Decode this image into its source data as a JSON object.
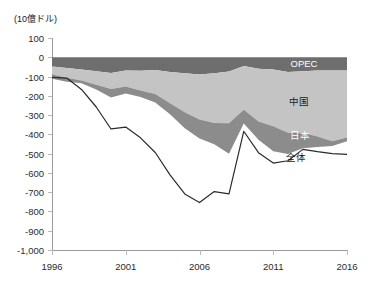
{
  "unit_label": "(10億ドル)",
  "axes": {
    "y_ticks": [
      100,
      0,
      -100,
      -200,
      -300,
      -400,
      -500,
      -600,
      -700,
      -800,
      -900,
      -1000
    ],
    "y_tick_labels": [
      "100",
      "0",
      "-100",
      "-200",
      "-300",
      "-400",
      "-500",
      "-600",
      "-700",
      "-800",
      "-900",
      "-1,000"
    ],
    "x_ticks": [
      1996,
      2001,
      2006,
      2011,
      2016
    ],
    "x_tick_labels": [
      "1996",
      "2001",
      "2006",
      "2011",
      "2016"
    ]
  },
  "labels": {
    "opec": "OPEC",
    "china": "中国",
    "japan": "日本",
    "total": "全体"
  },
  "colors": {
    "opec": "#8c8c8c",
    "china": "#c4c4c4",
    "japan": "#6e6e6e",
    "total_line": "#2b2b2b",
    "axis": "#9a9a9a",
    "tick": "#b9b9b9",
    "background": "#ffffff"
  },
  "chart_data": {
    "type": "area",
    "title": "",
    "subtitle": "",
    "xlabel": "",
    "ylabel": "(10億ドル)",
    "xlim": [
      1996,
      2016
    ],
    "ylim": [
      -1000,
      100
    ],
    "grid": false,
    "legend": "inline-annotations",
    "stacked": true,
    "x": [
      1996,
      1997,
      1998,
      1999,
      2000,
      2001,
      2002,
      2003,
      2004,
      2005,
      2006,
      2007,
      2008,
      2009,
      2010,
      2011,
      2012,
      2013,
      2014,
      2015,
      2016
    ],
    "series": [
      {
        "name": "日本",
        "values": [
          -48,
          -56,
          -64,
          -73,
          -81,
          -69,
          -70,
          -66,
          -76,
          -83,
          -89,
          -83,
          -74,
          -45,
          -60,
          -63,
          -76,
          -73,
          -68,
          -69,
          -69
        ]
      },
      {
        "name": "中国",
        "values": [
          -40,
          -50,
          -57,
          -69,
          -84,
          -83,
          -103,
          -124,
          -162,
          -202,
          -234,
          -258,
          -268,
          -227,
          -273,
          -295,
          -315,
          -319,
          -343,
          -367,
          -347
        ]
      },
      {
        "name": "OPEC",
        "values": [
          -24,
          -21,
          -14,
          -25,
          -44,
          -36,
          -33,
          -45,
          -57,
          -83,
          -98,
          -110,
          -158,
          -71,
          -95,
          -129,
          -111,
          -80,
          -55,
          -25,
          -20
        ]
      }
    ],
    "total_line": {
      "name": "全体",
      "values": [
        -104,
        -108,
        -167,
        -258,
        -372,
        -362,
        -418,
        -494,
        -610,
        -709,
        -754,
        -697,
        -709,
        -384,
        -495,
        -549,
        -537,
        -478,
        -490,
        -500,
        -504
      ]
    }
  }
}
